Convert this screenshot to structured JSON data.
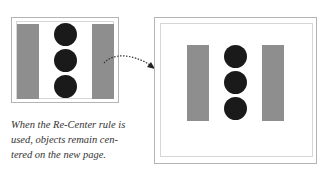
{
  "diagram": {
    "caption": "When the Re-Center rule is used, objects remain centered on the new page.",
    "caption_lines": [
      "When the Re-Center rule is",
      "used, objects remain cen-",
      "tered on the new page."
    ],
    "colors": {
      "bar": "#8e8e8e",
      "circle": "#1a1a1a",
      "border": "#b4b4b4"
    },
    "source_page": {
      "shapes": [
        "gray-bar-left",
        "circle-top",
        "circle-middle",
        "circle-bottom",
        "gray-bar-right"
      ]
    },
    "target_page": {
      "shapes": [
        "gray-bar-left",
        "circle-top",
        "circle-middle",
        "circle-bottom",
        "gray-bar-right"
      ]
    },
    "arrow": {
      "style": "dotted-curved",
      "from": "source_page",
      "to": "target_page"
    }
  }
}
